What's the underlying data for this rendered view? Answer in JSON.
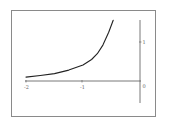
{
  "chart_data": {
    "type": "line",
    "title": "",
    "xlabel": "",
    "ylabel": "",
    "xlim": [
      -2,
      0
    ],
    "ylim": [
      -0.55,
      1.55
    ],
    "grid": false,
    "legend": null,
    "x_ticks": [
      {
        "value": -2,
        "label": "-2"
      },
      {
        "value": -1,
        "label": "-1"
      },
      {
        "value": 0,
        "label": "0"
      }
    ],
    "y_ticks": [
      {
        "value": 1,
        "label": "1"
      }
    ],
    "series": [
      {
        "name": "curve",
        "color": "#222222",
        "x": [
          -2.0,
          -1.75,
          -1.5,
          -1.25,
          -1.0,
          -0.85,
          -0.75,
          -0.65,
          -0.55,
          -0.47
        ],
        "y": [
          0.1,
          0.14,
          0.19,
          0.28,
          0.41,
          0.55,
          0.7,
          0.92,
          1.25,
          1.56
        ]
      }
    ]
  },
  "axes": {
    "x_label_neg2": "-2",
    "x_label_neg1": "-1",
    "x_label_zero": "0",
    "y_label_one": "1"
  }
}
